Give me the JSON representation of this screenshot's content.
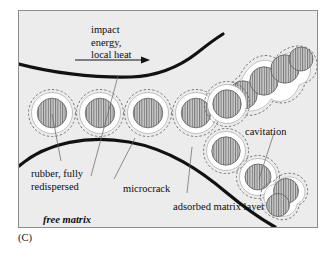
{
  "figure": {
    "caption": "(C)",
    "background_color": "#ececed",
    "frame_border_color": "#8d8d8d",
    "crack_line_color": "#111111",
    "particle_core_fill": "#c9c9c9",
    "particle_hatch_color": "#6f6f6f",
    "particle_shell_fill": "#ffffff",
    "dashed_outline_color": "#555555",
    "leader_line_color": "#6b6b6b"
  },
  "labels": {
    "impact_line1": "impact",
    "impact_line2": "energy,",
    "impact_line3": "local heat",
    "cavitation": "cavitation",
    "rubber_line1": "rubber, fully",
    "rubber_line2": "redispersed",
    "microcrack": "microcrack",
    "adsorbed_matrix_layer": "adsorbed matrix layer",
    "free_matrix": "free matrix"
  },
  "diagram_elements": {
    "arrow_name": "impact-energy-arrow",
    "upper_crack_name": "upper-crack-boundary",
    "lower_crack_name": "lower-crack-boundary",
    "particle_row_main": 5,
    "particle_chain_upper": 4,
    "particle_chain_lower": 3
  }
}
